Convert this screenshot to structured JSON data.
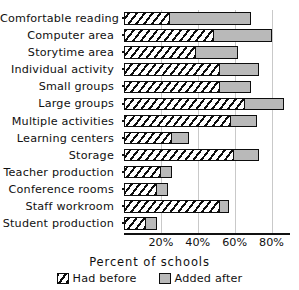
{
  "chart_data": {
    "type": "bar",
    "orientation": "horizontal",
    "stacked": true,
    "title": "",
    "xlabel": "Percent of schools",
    "ylabel": "",
    "xlim": [
      0,
      90
    ],
    "xticks": [
      20,
      40,
      60,
      80
    ],
    "xticklabels": [
      "20%",
      "40%",
      "60%",
      "80%"
    ],
    "grid": "vertical",
    "legend_position": "bottom",
    "categories": [
      "Comfortable reading",
      "Computer area",
      "Storytime area",
      "Individual activity",
      "Small groups",
      "Large groups",
      "Multiple activities",
      "Learning centers",
      "Storage",
      "Teacher production",
      "Conference rooms",
      "Staff workroom",
      "Student production"
    ],
    "series": [
      {
        "name": "Had before",
        "fill": "hatched",
        "values": [
          25,
          49,
          39,
          52,
          52,
          66,
          58,
          26,
          60,
          20,
          18,
          52,
          12
        ]
      },
      {
        "name": "Added after",
        "fill": "gray",
        "color": "#b9b9b9",
        "values": [
          44,
          31,
          23,
          21,
          17,
          21,
          14,
          9,
          13,
          6,
          6,
          5,
          6
        ]
      }
    ],
    "totals": [
      69,
      80,
      62,
      73,
      69,
      87,
      72,
      35,
      73,
      26,
      24,
      57,
      18
    ]
  },
  "legend": {
    "items": [
      {
        "label": "Had before"
      },
      {
        "label": "Added after"
      }
    ]
  }
}
